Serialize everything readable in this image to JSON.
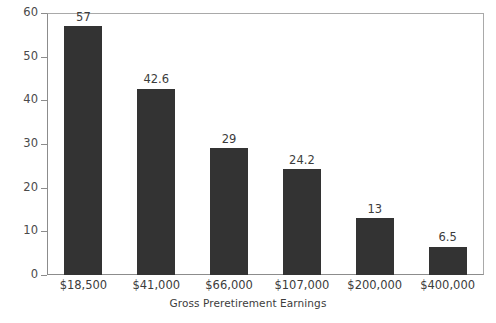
{
  "chart_data": {
    "type": "bar",
    "title": "",
    "subtitle": "",
    "xlabel": "Gross Preretirement Earnings",
    "ylabel": "",
    "categories": [
      "$18,500",
      "$41,000",
      "$66,000",
      "$107,000",
      "$200,000",
      "$400,000"
    ],
    "values": [
      57,
      42.6,
      29,
      24.2,
      13,
      6.5
    ],
    "value_labels": [
      "57",
      "42.6",
      "29",
      "24.2",
      "13",
      "6.5"
    ],
    "ylim": [
      0,
      60
    ],
    "yticks": [
      0,
      10,
      20,
      30,
      40,
      50,
      60
    ],
    "ytick_labels": [
      "0",
      "10",
      "20",
      "30",
      "40",
      "50",
      "60"
    ],
    "grid": false,
    "legend": false,
    "legend_position": "none",
    "bar_color": "#333333",
    "axis_color": "#8c8c8c",
    "text_color": "#3c3c3c",
    "background_color": "#ffffff"
  }
}
